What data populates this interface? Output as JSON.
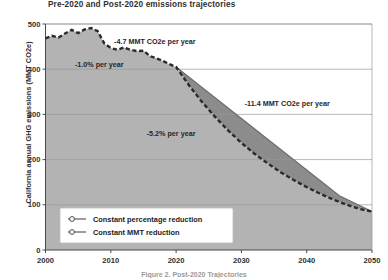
{
  "figure": {
    "title": "Pre-2020 and Post-2020 emissions trajectories",
    "caption": "Figure 2. Post-2020 Trajectories"
  },
  "chart_data": {
    "type": "line",
    "title": "Pre-2020 and Post-2020 emissions trajectories",
    "xlabel": "",
    "ylabel": "California annual GHG emissions (MMT CO2e)",
    "xlim": [
      2000,
      2050
    ],
    "ylim": [
      0,
      500
    ],
    "xticks": [
      "2000",
      "2010",
      "2020",
      "2030",
      "2040",
      "2050"
    ],
    "yticks": [
      "0",
      "100",
      "200",
      "300",
      "400",
      "500"
    ],
    "grid": "horizontal",
    "legend_position": "lower-left-inside",
    "series": [
      {
        "name": "Constant percentage reduction",
        "style": "dashed",
        "color": "#2b2b2b",
        "x": [
          2000,
          2001,
          2002,
          2003,
          2004,
          2005,
          2006,
          2007,
          2008,
          2009,
          2010,
          2011,
          2012,
          2013,
          2014,
          2015,
          2016,
          2017,
          2018,
          2019,
          2020,
          2022,
          2024,
          2026,
          2028,
          2030,
          2032,
          2034,
          2036,
          2038,
          2040,
          2042,
          2044,
          2046,
          2048,
          2050
        ],
        "values": [
          468,
          474,
          470,
          479,
          487,
          480,
          488,
          491,
          484,
          457,
          447,
          443,
          448,
          443,
          440,
          441,
          429,
          424,
          418,
          411,
          405,
          364,
          327,
          294,
          264,
          237,
          213,
          192,
          172,
          155,
          139,
          125,
          112,
          101,
          91,
          85
        ]
      },
      {
        "name": "Constant MMT reduction",
        "style": "solid",
        "color": "#6d6d6d",
        "x": [
          2020,
          2025,
          2030,
          2035,
          2040,
          2045,
          2050
        ],
        "values": [
          405,
          348,
          291,
          234,
          177,
          120,
          85
        ]
      }
    ],
    "annotations": [
      {
        "text": "-4.7 MMT CO2e per year",
        "x": 2010.5,
        "y": 455
      },
      {
        "text": "-1.0% per year",
        "x": 2004.5,
        "y": 405
      },
      {
        "text": "-5.2% per year",
        "x": 2015.5,
        "y": 252
      },
      {
        "text": "-11.4 MMT CO2e per year",
        "x": 2030.5,
        "y": 318
      }
    ],
    "legend": [
      {
        "label": "Constant percentage reduction",
        "marker": "circle-line",
        "style": "solid"
      },
      {
        "label": "Constant MMT reduction",
        "marker": "circle-line",
        "style": "solid"
      }
    ],
    "fills": [
      {
        "name": "area-under-curve",
        "color": "#b3b3b3"
      },
      {
        "name": "divergence-wedge",
        "color": "#8c8c8c"
      }
    ]
  }
}
